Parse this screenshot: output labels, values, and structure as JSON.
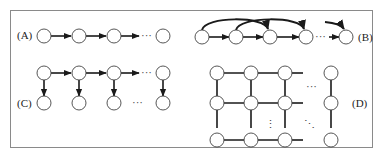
{
  "diagram": {
    "labels": {
      "a": "(A)",
      "b": "(B)",
      "c": "(C)",
      "d": "(D)"
    },
    "ellipsis_h": "···",
    "ellipsis_v": "⋮",
    "ellipsis_diag": "⋱",
    "panels": [
      {
        "id": "A",
        "description": "Linear chain of nodes with directed edges (first-order Markov chain)"
      },
      {
        "id": "B",
        "description": "Chain with additional skip edges to node two steps ahead (second-order Markov chain)"
      },
      {
        "id": "C",
        "description": "Chain of hidden nodes each emitting an observed node (hidden Markov model)"
      },
      {
        "id": "D",
        "description": "Undirected 2D grid lattice of nodes (Markov random field)"
      }
    ],
    "colors": {
      "stroke": "#1a1a1a",
      "node_fill": "#ffffff",
      "frame": "#8a8a8a"
    }
  }
}
